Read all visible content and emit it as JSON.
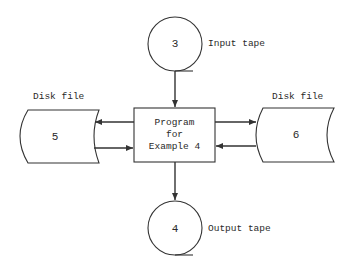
{
  "diagram": {
    "type": "system flowchart",
    "stroke_color": "#333333",
    "input_tape": {
      "number": "3",
      "label": "Input tape"
    },
    "output_tape": {
      "number": "4",
      "label": "Output tape"
    },
    "program": {
      "lines": [
        "Program",
        "for",
        "Example 4"
      ]
    },
    "disk_left": {
      "number": "5",
      "label": "Disk file"
    },
    "disk_right": {
      "number": "6",
      "label": "Disk file"
    },
    "connections": [
      {
        "from": "input_tape",
        "to": "program"
      },
      {
        "from": "program",
        "to": "disk_left"
      },
      {
        "from": "disk_left",
        "to": "program"
      },
      {
        "from": "program",
        "to": "disk_right"
      },
      {
        "from": "disk_right",
        "to": "program"
      },
      {
        "from": "program",
        "to": "output_tape"
      }
    ]
  }
}
